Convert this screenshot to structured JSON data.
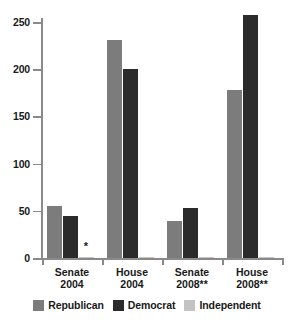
{
  "chart_data": {
    "type": "bar",
    "title": "",
    "subtitle": "",
    "xlabel": "",
    "ylabel": "",
    "categories": [
      "Senate 2004",
      "House 2004",
      "Senate 2008**",
      "House 2008**"
    ],
    "category_lines": [
      [
        "Senate",
        "2004"
      ],
      [
        "House",
        "2004"
      ],
      [
        "Senate",
        "2008**"
      ],
      [
        "House",
        "2008**"
      ]
    ],
    "series": [
      {
        "name": "Republican",
        "color": "#7c7c7c",
        "values": [
          55,
          231,
          39,
          178
        ]
      },
      {
        "name": "Democrat",
        "color": "#2b2b2b",
        "values": [
          44,
          200,
          53,
          257
        ]
      },
      {
        "name": "Independent",
        "color": "#c3c3c3",
        "values": [
          1,
          1,
          1,
          1
        ]
      }
    ],
    "ylim": [
      0,
      250
    ],
    "yticks": [
      0,
      50,
      100,
      150,
      200,
      250
    ],
    "ytick_labels": [
      "0",
      "50",
      "100",
      "150",
      "200",
      "250"
    ],
    "grid": false,
    "legend_position": "bottom",
    "annotations": [
      {
        "text": "*",
        "category": "Senate 2004",
        "series": "Independent"
      }
    ]
  },
  "legend": {
    "items": [
      {
        "label": "Republican",
        "swatch": "republican"
      },
      {
        "label": "Democrat",
        "swatch": "democrat"
      },
      {
        "label": "Independent",
        "swatch": "independent"
      }
    ]
  },
  "colors": {
    "republican": "#7c7c7c",
    "democrat": "#2b2b2b",
    "independent": "#c3c3c3",
    "axis": "#8a8a8a",
    "text": "#1a1a1a",
    "background": "#ffffff"
  }
}
